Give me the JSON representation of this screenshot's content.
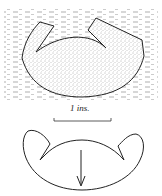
{
  "figure": {
    "upper": {
      "description": "stippled specimen in matrix"
    },
    "scale": {
      "label": "1 ins."
    },
    "lower": {
      "description": "outline drawing with arrow"
    }
  }
}
